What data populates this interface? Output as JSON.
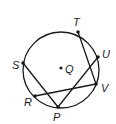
{
  "diagram": {
    "type": "circle-geometry",
    "circle": {
      "center_label": "Q",
      "cx": 61,
      "cy": 70,
      "r": 38
    },
    "points": [
      {
        "label": "T",
        "x": 78,
        "y": 32,
        "lx": 73,
        "ly": 26
      },
      {
        "label": "U",
        "x": 98,
        "y": 57,
        "lx": 102,
        "ly": 58
      },
      {
        "label": "S",
        "x": 23,
        "y": 63,
        "lx": 12,
        "ly": 69
      },
      {
        "label": "V",
        "x": 96,
        "y": 84,
        "lx": 101,
        "ly": 92
      },
      {
        "label": "R",
        "x": 35,
        "y": 96,
        "lx": 24,
        "ly": 106
      },
      {
        "label": "P",
        "x": 58,
        "y": 107,
        "lx": 53,
        "ly": 121
      }
    ],
    "center": {
      "label": "Q",
      "x": 61,
      "y": 68,
      "lx": 65,
      "ly": 73
    },
    "segments": [
      [
        "T",
        "V"
      ],
      [
        "S",
        "P"
      ],
      [
        "P",
        "U"
      ],
      [
        "R",
        "V"
      ]
    ],
    "colors": {
      "stroke": "#1a1a1a",
      "background": "#ffffff"
    }
  }
}
